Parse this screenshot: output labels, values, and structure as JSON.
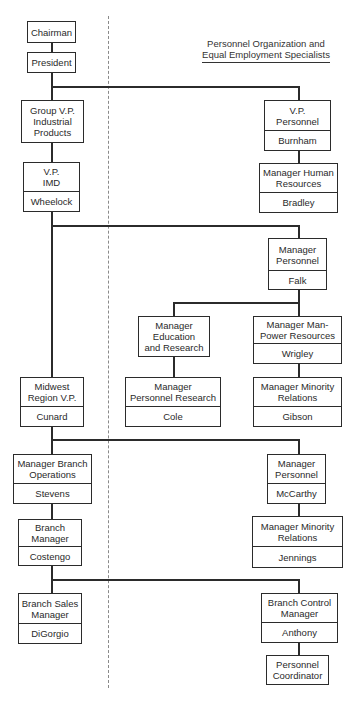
{
  "diagram": {
    "type": "org-chart",
    "title": {
      "line1": "Personnel Organization and",
      "line2": "Equal Employment Specialists"
    },
    "nodes": {
      "chairman": {
        "role": "Chairman"
      },
      "president": {
        "role": "President"
      },
      "group_vp": {
        "role": "Group V.P.\nIndustrial\nProducts"
      },
      "vp_imd": {
        "role": "V.P.\nIMD",
        "name": "Wheelock"
      },
      "vp_personnel": {
        "role": "V.P.\nPersonnel",
        "name": "Burnham"
      },
      "mgr_human_resources": {
        "role": "Manager Human\nResources",
        "name": "Bradley"
      },
      "mgr_personnel_falk": {
        "role": "Manager\nPersonnel",
        "name": "Falk"
      },
      "mgr_education_research": {
        "role": "Manager\nEducation\nand Research"
      },
      "mgr_manpower": {
        "role": "Manager Man-\nPower Resources",
        "name": "Wrigley"
      },
      "mgr_personnel_research": {
        "role": "Manager\nPersonnel Research",
        "name": "Cole"
      },
      "mgr_minority_gibson": {
        "role": "Manager Minority\nRelations",
        "name": "Gibson"
      },
      "midwest_vp": {
        "role": "Midwest\nRegion V.P.",
        "name": "Cunard"
      },
      "mgr_branch_ops": {
        "role": "Manager Branch\nOperations",
        "name": "Stevens"
      },
      "mgr_personnel_mccarthy": {
        "role": "Manager\nPersonnel",
        "name": "McCarthy"
      },
      "branch_manager": {
        "role": "Branch\nManager",
        "name": "Costengo"
      },
      "mgr_minority_jennings": {
        "role": "Manager Minority\nRelations",
        "name": "Jennings"
      },
      "branch_sales_mgr": {
        "role": "Branch Sales\nManager",
        "name": "DiGorgio"
      },
      "branch_control_mgr": {
        "role": "Branch Control\nManager",
        "name": "Anthony"
      },
      "personnel_coordinator": {
        "role": "Personnel\nCoordinator"
      }
    },
    "edges": [
      [
        "chairman",
        "president"
      ],
      [
        "president",
        "group_vp"
      ],
      [
        "president",
        "vp_personnel"
      ],
      [
        "group_vp",
        "vp_imd"
      ],
      [
        "vp_personnel",
        "mgr_human_resources"
      ],
      [
        "vp_imd",
        "midwest_vp"
      ],
      [
        "vp_imd",
        "mgr_personnel_falk"
      ],
      [
        "mgr_personnel_falk",
        "mgr_education_research"
      ],
      [
        "mgr_personnel_falk",
        "mgr_manpower"
      ],
      [
        "mgr_education_research",
        "mgr_personnel_research"
      ],
      [
        "mgr_manpower",
        "mgr_minority_gibson"
      ],
      [
        "midwest_vp",
        "mgr_branch_ops"
      ],
      [
        "midwest_vp",
        "mgr_personnel_mccarthy"
      ],
      [
        "mgr_branch_ops",
        "branch_manager"
      ],
      [
        "mgr_personnel_mccarthy",
        "mgr_minority_jennings"
      ],
      [
        "branch_manager",
        "branch_sales_mgr"
      ],
      [
        "branch_manager",
        "branch_control_mgr"
      ],
      [
        "branch_control_mgr",
        "personnel_coordinator"
      ]
    ],
    "divider": "dashed-vertical"
  }
}
